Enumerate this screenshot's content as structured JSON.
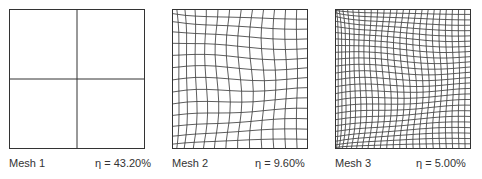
{
  "figure": {
    "panels": [
      {
        "name": "Mesh 1",
        "eta_symbol": "η",
        "eta_text": "η = 43.20%",
        "eta_value": "43.20%",
        "grid": "2x2 uniform"
      },
      {
        "name": "Mesh 2",
        "eta_symbol": "η",
        "eta_text": "η  = 9.60%",
        "eta_value": "9.60%",
        "grid": "adapted, refined toward top-left and bottom-left corners"
      },
      {
        "name": "Mesh 3",
        "eta_symbol": "η",
        "eta_text": "η  = 5.00%",
        "eta_value": "5.00%",
        "grid": "adapted, strongly refined toward top-left and bottom-left corners"
      }
    ],
    "colors": {
      "line": "#333333",
      "background": "#ffffff"
    }
  }
}
